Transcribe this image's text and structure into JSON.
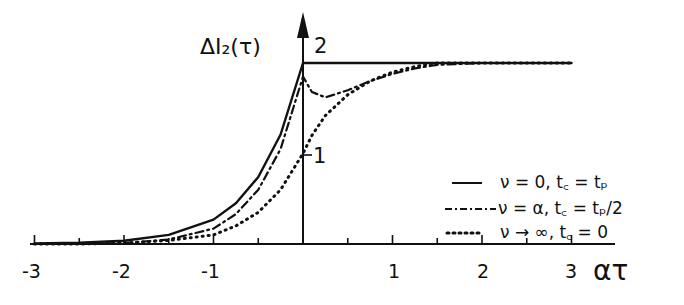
{
  "chart_data": {
    "type": "line",
    "title": "",
    "xlabel": "ατ",
    "ylabel": "ΔI₂(τ)",
    "xlim": [
      -3.1,
      3.1
    ],
    "ylim": [
      0,
      2.2
    ],
    "x_ticks": [
      -3,
      -2,
      -1,
      1,
      2,
      3
    ],
    "x_tick_labels": [
      "-3",
      "-2",
      "-1",
      "1",
      "2",
      "3"
    ],
    "y_ticks": [
      1,
      2
    ],
    "y_tick_labels": [
      "1",
      "2"
    ],
    "grid": false,
    "legend_position": "lower right",
    "x": [
      -3,
      -2.5,
      -2,
      -1.5,
      -1,
      -0.75,
      -0.5,
      -0.25,
      0,
      0.1,
      0.25,
      0.5,
      0.75,
      1,
      1.25,
      1.5,
      2,
      2.5,
      3
    ],
    "series": [
      {
        "name": "ν = 0, t_c = t_p",
        "style": "solid",
        "values": [
          0.005,
          0.013,
          0.037,
          0.1,
          0.27,
          0.45,
          0.74,
          1.21,
          2.0,
          2.0,
          2.0,
          2.0,
          2.0,
          2.0,
          2.0,
          2.0,
          2.0,
          2.0,
          2.0
        ]
      },
      {
        "name": "ν = α, t_c = t_p/2",
        "style": "dash-dot",
        "values": [
          0.0,
          0.0,
          0.01,
          0.05,
          0.17,
          0.33,
          0.6,
          1.05,
          1.85,
          1.68,
          1.62,
          1.7,
          1.8,
          1.88,
          1.94,
          1.98,
          2.0,
          2.0,
          2.0
        ]
      },
      {
        "name": "ν → ∞, t_c = 0",
        "style": "dotted",
        "values": [
          0.0,
          0.0,
          0.01,
          0.04,
          0.1,
          0.2,
          0.35,
          0.6,
          1.0,
          1.2,
          1.42,
          1.65,
          1.8,
          1.9,
          1.96,
          2.0,
          2.0,
          2.0,
          2.0
        ]
      }
    ]
  },
  "axis": {
    "ylabel": "ΔI₂(τ)",
    "xlabel": "ατ",
    "ytick_2": "2",
    "ytick_1": "1",
    "xticks": [
      "-3",
      "-2",
      "-1",
      "1",
      "2",
      "3"
    ]
  },
  "legend": [
    {
      "label": "ν = 0,  t꜀ = tₚ",
      "style": "solid"
    },
    {
      "label": "ν = α,  t꜀ = tₚ/2",
      "style": "dash-dot"
    },
    {
      "label": "ν → ∞,  t꜀ = 0",
      "style": "dotted"
    }
  ]
}
